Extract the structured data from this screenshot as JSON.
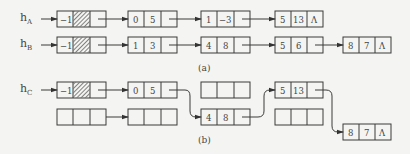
{
  "diagram": {
    "type": "linked-list-polynomial-addition",
    "part_a": {
      "caption": "(a)",
      "lists": [
        {
          "head_label": "h",
          "head_subscript": "A",
          "head_node": {
            "coef": "−1",
            "exp": "hatched"
          },
          "nodes": [
            {
              "coef": "0",
              "exp": "5",
              "next": "→"
            },
            {
              "coef": "1",
              "exp": "3",
              "next": "→",
              "note": "exponent shown with dash"
            },
            {
              "coef": "5",
              "exp": "13",
              "next": "Λ"
            }
          ]
        },
        {
          "head_label": "h",
          "head_subscript": "B",
          "head_node": {
            "coef": "−1",
            "exp": "hatched"
          },
          "nodes": [
            {
              "coef": "1",
              "exp": "3",
              "next": "→"
            },
            {
              "coef": "4",
              "exp": "8",
              "next": "→"
            },
            {
              "coef": "5",
              "exp": "6",
              "next": "→"
            },
            {
              "coef": "8",
              "exp": "7",
              "next": "Λ"
            }
          ]
        }
      ]
    },
    "part_b": {
      "caption": "(b)",
      "result_list": {
        "head_label": "h",
        "head_subscript": "C",
        "head_node": {
          "coef": "−1",
          "exp": "hatched"
        },
        "nodes": [
          {
            "coef": "0",
            "exp": "5",
            "next": "→"
          },
          {
            "coef": "4",
            "exp": "8",
            "next": "→"
          },
          {
            "coef": "5",
            "exp": "13",
            "next": "→"
          },
          {
            "coef": "8",
            "exp": "7",
            "next": "Λ"
          }
        ]
      },
      "freed_nodes": [
        "empty",
        "empty",
        "empty"
      ]
    },
    "text": {
      "hA": "h",
      "hA_sub": "A",
      "hB": "h",
      "hB_sub": "B",
      "hC": "h",
      "hC_sub": "C",
      "neg1": "−1",
      "caption_a": "(a)",
      "caption_b": "(b)",
      "null": "Λ",
      "a1c": "0",
      "a1e": "5",
      "a2c": "1",
      "a2e": "−3",
      "a3c": "5",
      "a3e": "13",
      "b1c": "1",
      "b1e": "3",
      "b2c": "4",
      "b2e": "8",
      "b3c": "5",
      "b3e": "6",
      "b4c": "8",
      "b4e": "7",
      "c1c": "0",
      "c1e": "5",
      "c2c": "4",
      "c2e": "8",
      "c3c": "5",
      "c3e": "13",
      "c4c": "8",
      "c4e": "7"
    },
    "colors": {
      "line": "#3a3a3a",
      "background": "#f4f4f2"
    }
  }
}
